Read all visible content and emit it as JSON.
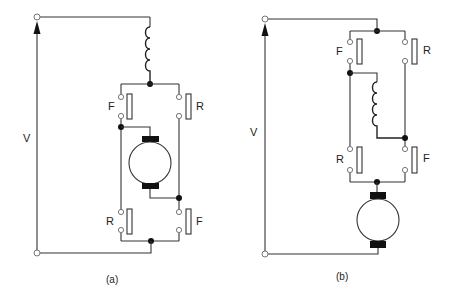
{
  "figure": {
    "panels": [
      {
        "id": "a",
        "caption": "(a)",
        "voltage_label": "V",
        "description": "Series DC motor reversing circuit: field winding in series, armature reversed via F/R contact pairs",
        "contacts": [
          {
            "label": "F",
            "position": "upper-left"
          },
          {
            "label": "R",
            "position": "upper-right"
          },
          {
            "label": "R",
            "position": "lower-left"
          },
          {
            "label": "F",
            "position": "lower-right"
          }
        ]
      },
      {
        "id": "b",
        "caption": "(b)",
        "voltage_label": "V",
        "description": "Series DC motor reversing circuit: field winding reversed via F/R contact pairs, armature in series",
        "contacts": [
          {
            "label": "F",
            "position": "upper-left"
          },
          {
            "label": "R",
            "position": "upper-right"
          },
          {
            "label": "R",
            "position": "lower-left"
          },
          {
            "label": "F",
            "position": "lower-right"
          }
        ]
      }
    ],
    "colors": {
      "line": "#333333",
      "fill": "#111111",
      "background": "#ffffff"
    }
  }
}
